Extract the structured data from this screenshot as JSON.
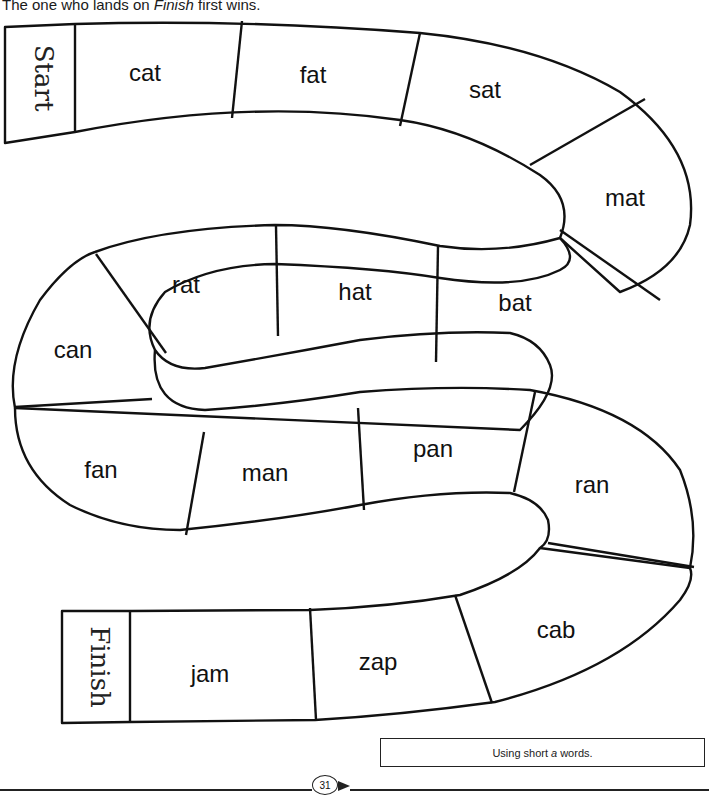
{
  "instructions": {
    "line_prefix": "The one who lands on ",
    "emphasis": "Finish",
    "line_suffix": " first wins."
  },
  "board": {
    "start_label": "Start",
    "finish_label": "Finish",
    "spaces": [
      {
        "word": "cat"
      },
      {
        "word": "fat"
      },
      {
        "word": "sat"
      },
      {
        "word": "mat"
      },
      {
        "word": "bat"
      },
      {
        "word": "hat"
      },
      {
        "word": "rat"
      },
      {
        "word": "can"
      },
      {
        "word": "fan"
      },
      {
        "word": "man"
      },
      {
        "word": "pan"
      },
      {
        "word": "ran"
      },
      {
        "word": "cab"
      },
      {
        "word": "zap"
      },
      {
        "word": "jam"
      }
    ]
  },
  "skill_box": {
    "prefix": "Using short",
    "emphasis": "a",
    "suffix": "words."
  },
  "footer": {
    "page_number": "31"
  },
  "colors": {
    "ink": "#111111",
    "paper": "#ffffff"
  }
}
